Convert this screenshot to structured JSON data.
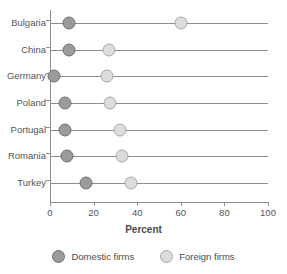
{
  "chart_data": {
    "type": "scatter",
    "title": "",
    "subtitle": "",
    "xlabel": "Percent",
    "ylabel": "",
    "xlim": [
      0,
      100
    ],
    "xticks": [
      0,
      20,
      40,
      60,
      80,
      100
    ],
    "xtick_labels": [
      "0",
      "20",
      "40",
      "60",
      "80",
      "100"
    ],
    "grid": false,
    "legend_position": "bottom",
    "categories": [
      "Bulgaria",
      "China",
      "Germany",
      "Poland",
      "Portugal",
      "Romania",
      "Turkey"
    ],
    "series": [
      {
        "name": "Domestic firms",
        "color": "#9b9b9b",
        "values": [
          8.5,
          8.5,
          2,
          7,
          7,
          8,
          16.5
        ]
      },
      {
        "name": "Foreign firms",
        "color": "#dcdcdc",
        "values": [
          60,
          27,
          26,
          27.5,
          32,
          33,
          37
        ]
      }
    ]
  },
  "legend": {
    "items": [
      {
        "label": "Domestic firms",
        "marker": "filled-circle-dark"
      },
      {
        "label": "Foreign firms",
        "marker": "filled-circle-light"
      }
    ]
  },
  "colors": {
    "axis": "#8e8e8e",
    "text": "#4a4a4a",
    "domestic": "#9b9b9b",
    "foreign": "#dcdcdc",
    "background": "#ffffff"
  }
}
